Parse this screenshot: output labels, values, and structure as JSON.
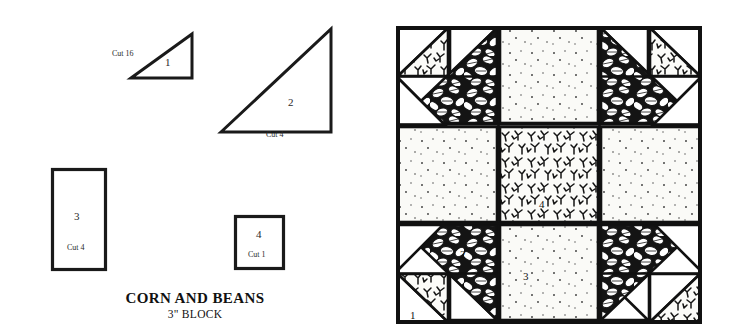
{
  "document": {
    "title": "CORN AND BEANS",
    "subtitle": "3\" BLOCK"
  },
  "colors": {
    "ink": "#111111",
    "paper": "#ffffff",
    "leaf_print": "#1a1a1a",
    "sprig_print": "#1a1a1a",
    "dot_print": "#f7f7f4"
  },
  "templates": [
    {
      "id": "piece-1",
      "number": "1",
      "cut": "Cut 16",
      "shape": "right-triangle",
      "orientation": "right-angle-bottom-right"
    },
    {
      "id": "piece-2",
      "number": "2",
      "cut": "Cut 4",
      "shape": "right-triangle",
      "orientation": "right-angle-bottom-right"
    },
    {
      "id": "piece-3",
      "number": "3",
      "cut": "Cut 4",
      "shape": "rectangle"
    },
    {
      "id": "piece-4",
      "number": "4",
      "cut": "Cut 1",
      "shape": "square"
    }
  ],
  "block": {
    "name": "CORN AND BEANS",
    "size": "3\" BLOCK",
    "grid": "6 x 6 units",
    "labels": [
      {
        "id": "block-label-1",
        "text": "1"
      },
      {
        "id": "block-label-2",
        "text": "2"
      },
      {
        "id": "block-label-3",
        "text": "3"
      },
      {
        "id": "block-label-4",
        "text": "4"
      }
    ],
    "fabrics": [
      {
        "name": "leaf-print",
        "used_by": "piece 2 large triangles"
      },
      {
        "name": "sprig-print",
        "used_by": "piece 1 small triangles and piece 4 center square"
      },
      {
        "name": "dot-print",
        "used_by": "piece 3 rectangles"
      },
      {
        "name": "plain-white",
        "used_by": "background triangles and rectangles"
      }
    ]
  }
}
